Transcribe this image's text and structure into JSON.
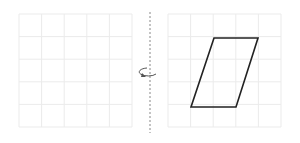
{
  "figure": {
    "left_grid": {
      "x": 19,
      "y": 14,
      "cols": 5,
      "rows": 5,
      "cell": 22.6,
      "color": "#ebebeb"
    },
    "right_grid": {
      "x": 168,
      "y": 14,
      "cols": 5,
      "rows": 5,
      "cell": 22.6,
      "color": "#ebebeb"
    },
    "axis": {
      "x": 150,
      "y1": 12,
      "y2": 133,
      "color": "#888888"
    },
    "rotation_arrow": {
      "cx": 150,
      "cy": 72,
      "color": "#555555"
    },
    "shape": {
      "type": "parallelogram",
      "points": [
        [
          214,
          38
        ],
        [
          258,
          38
        ],
        [
          236,
          107
        ],
        [
          191,
          107
        ]
      ],
      "stroke": "#222222"
    }
  }
}
